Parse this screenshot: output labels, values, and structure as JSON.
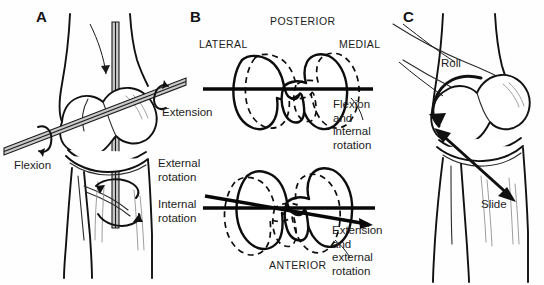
{
  "figure": {
    "background_color": "#fefefe",
    "ink_color": "#111111",
    "rod_color": "#c9c9c9",
    "width": 544,
    "height": 285
  },
  "panels": [
    {
      "id": "A",
      "letter": "A",
      "view": "anterior view of knee with rotation axes",
      "labels": [
        {
          "name": "flexion",
          "text": "Flexion"
        },
        {
          "name": "extension",
          "text": "Extension"
        },
        {
          "name": "external-rotation",
          "text": "External\nrotation"
        },
        {
          "name": "internal-rotation",
          "text": "Internal\nrotation"
        }
      ]
    },
    {
      "id": "B",
      "letter": "B",
      "view": "superior view of tibial plateau showing rotation",
      "orientation_labels": [
        {
          "name": "posterior",
          "text": "POSTERIOR"
        },
        {
          "name": "lateral",
          "text": "LATERAL"
        },
        {
          "name": "medial",
          "text": "MEDIAL"
        },
        {
          "name": "anterior",
          "text": "ANTERIOR"
        }
      ],
      "labels": [
        {
          "name": "flexion-internal-rotation",
          "text": "Flexion\nand internal\nrotation"
        },
        {
          "name": "extension-external-rotation",
          "text": "Extension\nand external\nrotation"
        }
      ]
    },
    {
      "id": "C",
      "letter": "C",
      "view": "lateral view of knee showing roll and slide",
      "labels": [
        {
          "name": "roll",
          "text": "Roll"
        },
        {
          "name": "slide",
          "text": "Slide"
        }
      ]
    }
  ]
}
